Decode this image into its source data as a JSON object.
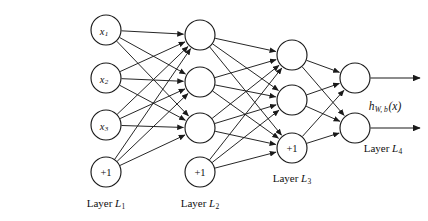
{
  "diagram": {
    "background_color": "#ffffff",
    "stroke_color": "#1a1a1a",
    "width": 428,
    "height": 221
  },
  "layers": [
    {
      "id": "L1",
      "label": "Layer",
      "label_symbol": "L",
      "label_subscript": "1",
      "label_x": 106,
      "label_y": 203,
      "column_x": 106,
      "role": "input",
      "nodes": [
        {
          "name": "input-x1",
          "text": "x",
          "subscript": "1",
          "kind": "unit",
          "cx": 106,
          "cy": 30,
          "r": 15
        },
        {
          "name": "input-x2",
          "text": "x",
          "subscript": "2",
          "kind": "unit",
          "cx": 106,
          "cy": 78,
          "r": 15
        },
        {
          "name": "input-x3",
          "text": "x",
          "subscript": "3",
          "kind": "unit",
          "cx": 106,
          "cy": 125,
          "r": 15
        },
        {
          "name": "bias-l1",
          "text": "+1",
          "subscript": "",
          "kind": "bias",
          "cx": 106,
          "cy": 172,
          "r": 15
        }
      ]
    },
    {
      "id": "L2",
      "label": "Layer",
      "label_symbol": "L",
      "label_subscript": "2",
      "label_x": 200,
      "label_y": 203,
      "column_x": 200,
      "role": "hidden",
      "nodes": [
        {
          "name": "hidden-l2-1",
          "text": "",
          "subscript": "",
          "kind": "unit",
          "cx": 200,
          "cy": 35,
          "r": 15
        },
        {
          "name": "hidden-l2-2",
          "text": "",
          "subscript": "",
          "kind": "unit",
          "cx": 200,
          "cy": 82,
          "r": 15
        },
        {
          "name": "hidden-l2-3",
          "text": "",
          "subscript": "",
          "kind": "unit",
          "cx": 200,
          "cy": 128,
          "r": 15
        },
        {
          "name": "bias-l2",
          "text": "+1",
          "subscript": "",
          "kind": "bias",
          "cx": 200,
          "cy": 172,
          "r": 15
        }
      ]
    },
    {
      "id": "L3",
      "label": "Layer",
      "label_symbol": "L",
      "label_subscript": "3",
      "label_x": 292,
      "label_y": 178,
      "column_x": 292,
      "role": "hidden",
      "nodes": [
        {
          "name": "hidden-l3-1",
          "text": "",
          "subscript": "",
          "kind": "unit",
          "cx": 292,
          "cy": 55,
          "r": 15
        },
        {
          "name": "hidden-l3-2",
          "text": "",
          "subscript": "",
          "kind": "unit",
          "cx": 292,
          "cy": 100,
          "r": 15
        },
        {
          "name": "bias-l3",
          "text": "+1",
          "subscript": "",
          "kind": "bias",
          "cx": 292,
          "cy": 148,
          "r": 15
        }
      ]
    },
    {
      "id": "L4",
      "label": "Layer",
      "label_symbol": "L",
      "label_subscript": "4",
      "label_x": 383,
      "label_y": 148,
      "column_x": 355,
      "role": "output",
      "nodes": [
        {
          "name": "output-node-1",
          "text": "",
          "subscript": "",
          "kind": "unit",
          "cx": 355,
          "cy": 78,
          "r": 15
        },
        {
          "name": "output-node-2",
          "text": "",
          "subscript": "",
          "kind": "unit",
          "cx": 355,
          "cy": 128,
          "r": 15
        }
      ]
    }
  ],
  "connections": [
    {
      "from": "input-x1",
      "to": "hidden-l2-1"
    },
    {
      "from": "input-x1",
      "to": "hidden-l2-2"
    },
    {
      "from": "input-x1",
      "to": "hidden-l2-3"
    },
    {
      "from": "input-x2",
      "to": "hidden-l2-1"
    },
    {
      "from": "input-x2",
      "to": "hidden-l2-2"
    },
    {
      "from": "input-x2",
      "to": "hidden-l2-3"
    },
    {
      "from": "input-x3",
      "to": "hidden-l2-1"
    },
    {
      "from": "input-x3",
      "to": "hidden-l2-2"
    },
    {
      "from": "input-x3",
      "to": "hidden-l2-3"
    },
    {
      "from": "bias-l1",
      "to": "hidden-l2-1"
    },
    {
      "from": "bias-l1",
      "to": "hidden-l2-2"
    },
    {
      "from": "bias-l1",
      "to": "hidden-l2-3"
    },
    {
      "from": "hidden-l2-1",
      "to": "hidden-l3-1"
    },
    {
      "from": "hidden-l2-1",
      "to": "hidden-l3-2"
    },
    {
      "from": "hidden-l2-1",
      "to": "bias-l3"
    },
    {
      "from": "hidden-l2-2",
      "to": "hidden-l3-1"
    },
    {
      "from": "hidden-l2-2",
      "to": "hidden-l3-2"
    },
    {
      "from": "hidden-l2-2",
      "to": "bias-l3"
    },
    {
      "from": "hidden-l2-3",
      "to": "hidden-l3-1"
    },
    {
      "from": "hidden-l2-3",
      "to": "hidden-l3-2"
    },
    {
      "from": "hidden-l2-3",
      "to": "bias-l3"
    },
    {
      "from": "bias-l2",
      "to": "hidden-l3-1"
    },
    {
      "from": "bias-l2",
      "to": "hidden-l3-2"
    },
    {
      "from": "bias-l2",
      "to": "bias-l3"
    },
    {
      "from": "hidden-l3-1",
      "to": "output-node-1"
    },
    {
      "from": "hidden-l3-1",
      "to": "output-node-2"
    },
    {
      "from": "hidden-l3-2",
      "to": "output-node-1"
    },
    {
      "from": "hidden-l3-2",
      "to": "output-node-2"
    },
    {
      "from": "bias-l3",
      "to": "output-node-1"
    },
    {
      "from": "bias-l3",
      "to": "output-node-2"
    }
  ],
  "outputs": [
    {
      "name": "output-arrow-1",
      "from": "output-node-1",
      "x2": 420,
      "y": 78
    },
    {
      "name": "output-arrow-2",
      "from": "output-node-2",
      "x2": 420,
      "y": 128
    }
  ],
  "annotations": [
    {
      "name": "hypothesis-label",
      "symbol": "h",
      "subscript": "W, b",
      "argument": "(x)",
      "x": 385,
      "y": 106
    }
  ]
}
